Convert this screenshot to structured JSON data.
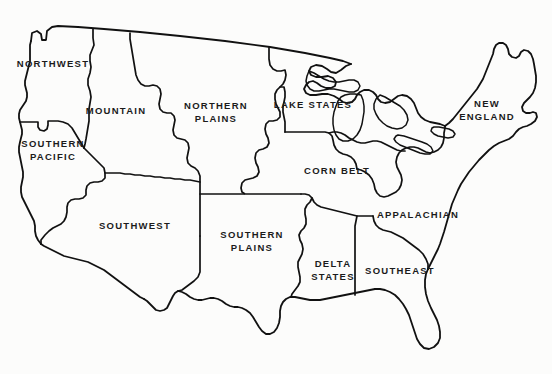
{
  "map": {
    "title": "Farm Production Regions of the United States",
    "background_color": "#fcfcfb",
    "line_color": "#111111",
    "width": 552,
    "height": 374,
    "regions": [
      {
        "id": "northwest",
        "label": "NORTHWEST",
        "x": 53,
        "y": 63
      },
      {
        "id": "mountain",
        "label": "MOUNTAIN",
        "x": 116,
        "y": 110
      },
      {
        "id": "northern-plains",
        "label": "NORTHERN\nPLAINS",
        "x": 216,
        "y": 112
      },
      {
        "id": "lake-states",
        "label": "LAKE STATES",
        "x": 313,
        "y": 104
      },
      {
        "id": "new-england",
        "label": "NEW\nENGLAND",
        "x": 487,
        "y": 110
      },
      {
        "id": "southern-pacific",
        "label": "SOUTHERN\nPACIFIC",
        "x": 53,
        "y": 150
      },
      {
        "id": "corn-belt",
        "label": "CORN BELT",
        "x": 337,
        "y": 170
      },
      {
        "id": "appalachian",
        "label": "APPALACHIAN",
        "x": 418,
        "y": 214
      },
      {
        "id": "southwest",
        "label": "SOUTHWEST",
        "x": 135,
        "y": 225
      },
      {
        "id": "southern-plains",
        "label": "SOUTHERN\nPLAINS",
        "x": 252,
        "y": 241
      },
      {
        "id": "delta-states",
        "label": "DELTA\nSTATES",
        "x": 333,
        "y": 270
      },
      {
        "id": "southeast",
        "label": "SOUTHEAST",
        "x": 400,
        "y": 270
      }
    ]
  }
}
